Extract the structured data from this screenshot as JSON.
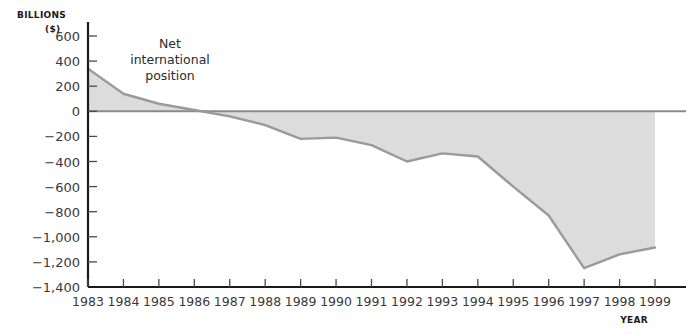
{
  "chart_data": {
    "type": "area",
    "title": "",
    "ylabel_line1": "BILLIONS",
    "ylabel_line2": "($)",
    "xlabel": "YEAR",
    "annotation": {
      "line1": "Net",
      "line2": "international",
      "line3": "position"
    },
    "categories": [
      "1983",
      "1984",
      "1985",
      "1986",
      "1987",
      "1988",
      "1989",
      "1990",
      "1991",
      "1992",
      "1993",
      "1994",
      "1995",
      "1996",
      "1997",
      "1998",
      "1999"
    ],
    "values": [
      340,
      140,
      60,
      10,
      -40,
      -110,
      -220,
      -210,
      -270,
      -400,
      -335,
      -360,
      -600,
      -830,
      -1250,
      -1140,
      -1085
    ],
    "ylim": [
      -1400,
      600
    ],
    "yticks": [
      "600",
      "400",
      "200",
      "0",
      "−200",
      "−400",
      "−600",
      "−800",
      "−1,000",
      "−1,200",
      "−1,400"
    ],
    "ytick_values": [
      600,
      400,
      200,
      0,
      -200,
      -400,
      -600,
      -800,
      -1000,
      -1200,
      -1400
    ],
    "grid": false,
    "legend": "none",
    "colors": {
      "area_fill": "#dcdcdc",
      "series_line": "#9a9a9a",
      "axis": "#1a1a1a",
      "zero_line": "#8a8a8a",
      "text": "#3a3a3a"
    }
  }
}
